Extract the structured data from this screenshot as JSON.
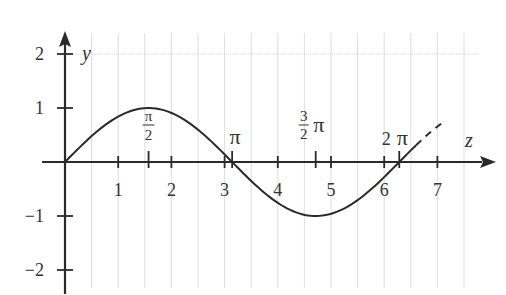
{
  "chart_data": {
    "type": "line",
    "title": "",
    "xlabel": "z",
    "ylabel": "y",
    "function": "y = sin(z)",
    "xlim": [
      0,
      7.5
    ],
    "ylim": [
      -2.4,
      2.4
    ],
    "grid": true,
    "grid_step": 0.5,
    "x_ticks": [
      {
        "value": 1,
        "label": "1"
      },
      {
        "value": 2,
        "label": "2"
      },
      {
        "value": 3,
        "label": "3"
      },
      {
        "value": 4,
        "label": "4"
      },
      {
        "value": 5,
        "label": "5"
      },
      {
        "value": 6,
        "label": "6"
      },
      {
        "value": 7,
        "label": "7"
      }
    ],
    "pi_ticks": [
      {
        "value": 1.5708,
        "label_num": "π",
        "label_den": "2",
        "label": "π/2"
      },
      {
        "value": 3.1416,
        "label": "π"
      },
      {
        "value": 4.7124,
        "label_num": "3",
        "label_den": "2",
        "label": "3/2 π",
        "suffix": "π"
      },
      {
        "value": 6.2832,
        "label": "2π",
        "prefix": "2",
        "suffix": "π"
      }
    ],
    "y_ticks": [
      {
        "value": 2,
        "label": "2"
      },
      {
        "value": 1,
        "label": "1"
      },
      {
        "value": -1,
        "label": "−1"
      },
      {
        "value": -2,
        "label": "−2"
      }
    ],
    "series": [
      {
        "name": "sin(z) solid",
        "style": "solid",
        "x_range": [
          0,
          6.6
        ]
      },
      {
        "name": "sin(z) continuation",
        "style": "dashed",
        "x_range": [
          6.6,
          7.15
        ]
      }
    ],
    "sample_points": [
      {
        "x": 0,
        "y": 0
      },
      {
        "x": 1.5708,
        "y": 1
      },
      {
        "x": 3.1416,
        "y": 0
      },
      {
        "x": 4.7124,
        "y": -1
      },
      {
        "x": 6.2832,
        "y": 0
      },
      {
        "x": 7.1,
        "y": 0.73
      }
    ],
    "colors": {
      "axis": "#2a2a2a",
      "curve": "#2a2a2a",
      "grid": "#c8c8c8",
      "text": "#333333",
      "background": "#ffffff"
    }
  }
}
